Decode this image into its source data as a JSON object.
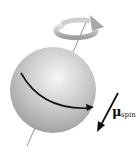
{
  "diagram": {
    "label": {
      "symbol": "μ",
      "subscript": "spin"
    },
    "colors": {
      "sphere_light": "#f4f4f4",
      "sphere_mid": "#c4c4c4",
      "sphere_dark": "#9a9a9a",
      "arrow": "#111111",
      "ring": "#b8b8b8",
      "axis": "#777777"
    }
  }
}
